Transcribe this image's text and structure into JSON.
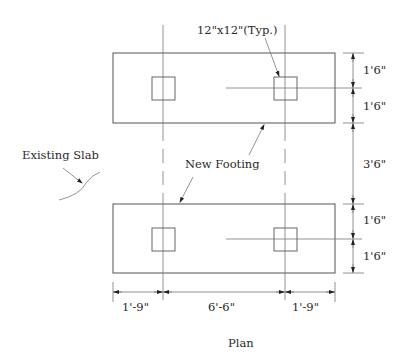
{
  "drawing": {
    "title": "Plan",
    "labels": {
      "column_size": "12\"x12\"(Typ.)",
      "existing_slab": "Existing Slab",
      "new_footing": "New Footing"
    },
    "dimensions": {
      "right": [
        "1'6\"",
        "1'6\"",
        "3'6\"",
        "1'6\"",
        "1'6\""
      ],
      "bottom": [
        "1'-9\"",
        "6'-6\"",
        "1'-9\""
      ]
    },
    "colors": {
      "line": "#555555",
      "text": "#2a2a2a",
      "background": "#ffffff"
    }
  }
}
